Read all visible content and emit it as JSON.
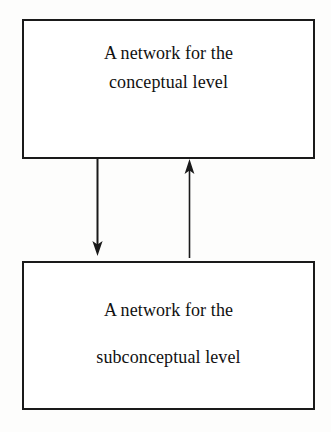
{
  "diagram": {
    "background_color": "#fdfdfc",
    "stroke_color": "#1a1a1a",
    "text_color": "#111111",
    "nodes": [
      {
        "id": "conceptual",
        "lines": [
          "A network for the",
          "conceptual level"
        ],
        "line1": "A network for the",
        "line2": "conceptual level"
      },
      {
        "id": "subconceptual",
        "lines": [
          "A network for the",
          "subconceptual level"
        ],
        "line1": "A network for the",
        "line2": "subconceptual level"
      }
    ],
    "edges": [
      {
        "id": "conceptual-to-subconceptual",
        "direction": "down",
        "from": "conceptual",
        "to": "subconceptual",
        "label": ""
      },
      {
        "id": "subconceptual-to-conceptual",
        "direction": "up",
        "from": "subconceptual",
        "to": "conceptual",
        "label": ""
      }
    ]
  }
}
